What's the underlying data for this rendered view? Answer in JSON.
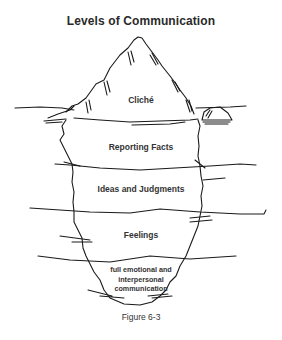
{
  "title": "Levels of Communication",
  "levels": [
    {
      "label": "Cliché",
      "zone": "above-water"
    },
    {
      "label": "Reporting Facts",
      "zone": "below-water"
    },
    {
      "label": "Ideas and Judgments",
      "zone": "below-water"
    },
    {
      "label": "Feelings",
      "zone": "below-water"
    },
    {
      "label_lines": [
        "full emotional and",
        "interpersonal",
        "communication"
      ],
      "zone": "deepest"
    }
  ],
  "caption": "Figure 6-3",
  "colors": {
    "ink": "#1a1a1a",
    "text": "#333333",
    "background": "#ffffff"
  }
}
